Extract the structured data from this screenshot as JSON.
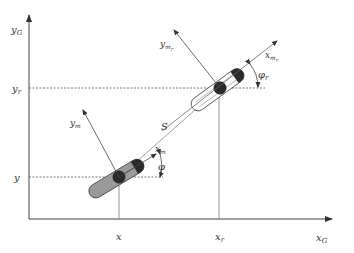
{
  "diagram": {
    "colors": {
      "axis": "#444444",
      "line": "#666666",
      "dashed": "#555555",
      "robot_body_current": "#9a9a9a",
      "robot_body_reference": "#ffffff",
      "robot_cap": "#2a2a2a"
    },
    "axes": {
      "x_label": "x",
      "x_sub": "G",
      "y_label": "y",
      "y_sub": "G"
    },
    "robot_current": {
      "x_tick": "x",
      "y_tick": "y",
      "x_axis_label": "x",
      "x_axis_sub": "m",
      "y_axis_label": "y",
      "y_axis_sub": "m",
      "angle_label": "φ"
    },
    "robot_reference": {
      "x_tick": "x",
      "x_tick_sub": "r",
      "y_tick": "y",
      "y_tick_sub": "r",
      "x_axis_label": "x",
      "x_axis_sub": "m",
      "x_axis_subsub": "r",
      "y_axis_label": "y",
      "y_axis_sub": "m",
      "y_axis_subsub": "r",
      "angle_label": "φ",
      "angle_sub": "r"
    },
    "distance_label": "S"
  }
}
